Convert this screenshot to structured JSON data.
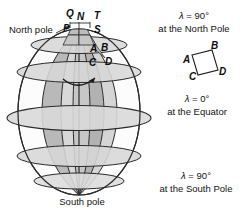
{
  "figure": {
    "title_alt": "Sphere divided by meridians and parallels showing convergence of meridians",
    "colors": {
      "background": "#ffffff",
      "outline": "#2b2b2b",
      "lune_shade": "#b9b9b9",
      "lune_shade_light": "#c9c9c9",
      "disc_fill": "#d2d2d2",
      "disc_fill_light": "#dcdcdc",
      "text": "#141414"
    },
    "sphere": {
      "cx": 79,
      "cy": 112,
      "rx": 61,
      "ry": 83
    }
  },
  "labels": {
    "north_pole": "North pole",
    "south_pole": "South pole",
    "point_q": "Q",
    "point_n": "N",
    "point_t": "T",
    "point_p": "P",
    "point_s": "S",
    "cell_a": "A",
    "cell_b": "B",
    "cell_c": "C",
    "cell_d": "D"
  },
  "inset": {
    "point_a": "A",
    "point_b": "B",
    "point_c": "C",
    "point_d": "D"
  },
  "annotations": {
    "north": {
      "line1_symbol": "λ",
      "line1": " = 90°",
      "line2": "at the North Pole"
    },
    "equator": {
      "line1_symbol": "λ",
      "line1": " = 0°",
      "line2": "at the Equator"
    },
    "south": {
      "line1_symbol": "λ",
      "line1": " = 90°",
      "line2": "at the South Pole"
    }
  }
}
